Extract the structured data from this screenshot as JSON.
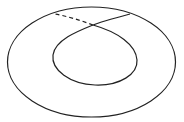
{
  "diagram": {
    "type": "topology-curve",
    "stroke_color": "#222222",
    "background": "#ffffff",
    "outer_ellipse": {
      "cx": 91.5,
      "cy": 62,
      "rx": 84,
      "ry": 55
    },
    "crossing_point": {
      "x": 93,
      "y": 25
    },
    "solid_branch_end": {
      "x": 130,
      "y": 14
    },
    "dashed_branch_end": {
      "x": 55,
      "y": 14
    }
  }
}
